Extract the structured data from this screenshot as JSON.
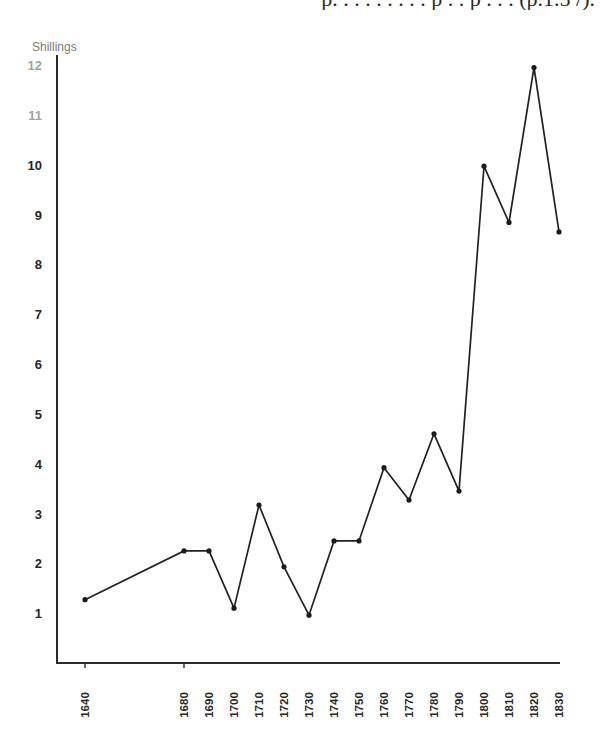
{
  "page": {
    "cut_text": "p. . . . . . . . . p . . p . . . (p.1.5 /)."
  },
  "chart_data": {
    "type": "line",
    "title": "",
    "ylabel": "Shillings",
    "xlabel": "",
    "x": [
      1640,
      1680,
      1690,
      1700,
      1710,
      1720,
      1730,
      1740,
      1750,
      1760,
      1770,
      1780,
      1790,
      1800,
      1810,
      1820,
      1830
    ],
    "series": [
      {
        "name": "Price (shillings)",
        "values": [
          1.27,
          2.25,
          2.25,
          1.1,
          3.17,
          1.93,
          0.96,
          2.45,
          2.45,
          3.92,
          3.27,
          4.6,
          3.45,
          9.97,
          8.84,
          11.95,
          8.65
        ],
        "color": "#222222",
        "markers": true
      }
    ],
    "x_tick_labels": [
      "1640",
      "1680",
      "1690",
      "1700",
      "1710",
      "1720",
      "1730",
      "1740",
      "1750",
      "1760",
      "1770",
      "1780",
      "1790",
      "1800",
      "1810",
      "1820",
      "1830"
    ],
    "y_ticks": [
      1,
      2,
      3,
      4,
      5,
      6,
      7,
      8,
      9,
      10,
      11,
      12
    ],
    "y_tick_labels": [
      "1",
      "2",
      "3",
      "4",
      "5",
      "6",
      "7",
      "8",
      "9",
      "10",
      "11",
      "12"
    ],
    "xlim": [
      1630,
      1832
    ],
    "ylim": [
      0,
      12
    ],
    "x_tick_marks": [
      1640,
      1680
    ],
    "grid": false,
    "legend": "none"
  }
}
